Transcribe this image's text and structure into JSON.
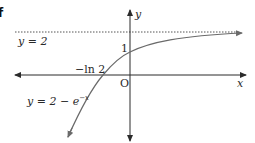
{
  "figure": {
    "corner_mark": "f",
    "asymptote_label": "y = 2",
    "curve_label": "y = 2 − e",
    "curve_label_exponent": "−x",
    "y_intercept_label": "1",
    "x_intercept_label": "−ln 2",
    "origin_label": "O",
    "x_axis_label": "x",
    "y_axis_label": "y",
    "colors": {
      "axis": "#2b2b2b",
      "curve": "#6a6a6a",
      "asymptote": "#555555",
      "text": "#2a2a2a"
    },
    "function": "y = 2 - e^(-x)",
    "asymptote": "y = 2",
    "intercepts": {
      "x": "-ln 2",
      "y": "1"
    }
  }
}
